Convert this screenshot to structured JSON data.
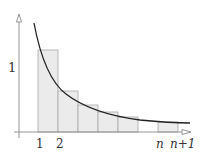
{
  "diagram": {
    "title": "",
    "function": "1/x",
    "y_tick_label": "1",
    "x_tick_labels": [
      "1",
      "2",
      "n",
      "n+1"
    ],
    "rect_fill": "#ebebeb",
    "rect_stroke": "#a8a8a8",
    "curve_color": "#222222",
    "axis_color": "#8a8a8a"
  }
}
